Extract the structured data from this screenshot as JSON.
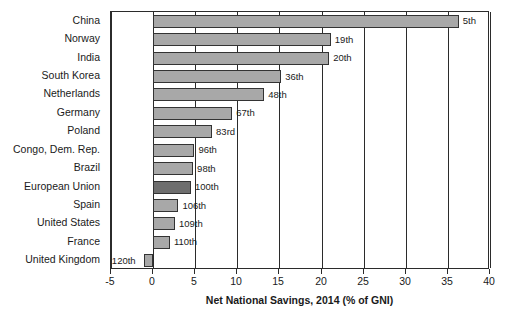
{
  "chart_data": {
    "type": "bar",
    "orientation": "horizontal",
    "title": "",
    "xlabel": "Net National Savings, 2014 (% of GNI)",
    "ylabel": "",
    "xlim": [
      -5,
      40
    ],
    "xticks": [
      -5,
      0,
      5,
      10,
      15,
      20,
      25,
      30,
      35,
      40
    ],
    "xtick_labels": [
      "-5",
      "0",
      "5",
      "10",
      "15",
      "20",
      "25",
      "30",
      "35",
      "40"
    ],
    "grid": true,
    "grid_axis": "x",
    "legend": "none",
    "categories": [
      "China",
      "Norway",
      "India",
      "South Korea",
      "Netherlands",
      "Germany",
      "Poland",
      "Congo, Dem. Rep.",
      "Brazil",
      "European Union",
      "Spain",
      "United States",
      "France",
      "United Kingdom"
    ],
    "values": [
      36.3,
      21.1,
      20.9,
      15.2,
      13.2,
      9.4,
      7.0,
      4.9,
      4.75,
      4.5,
      3.0,
      2.6,
      2.0,
      -1.1
    ],
    "annotations": [
      "5th",
      "19th",
      "20th",
      "36th",
      "48th",
      "67th",
      "83rd",
      "96th",
      "98th",
      "100th",
      "106th",
      "109th",
      "110th",
      "120th"
    ],
    "highlight_category": "European Union",
    "colors": {
      "bar": "#a8a8a8",
      "bar_highlight": "#6e6e6e",
      "bar_edge": "#333333",
      "axis": "#2b2b2b",
      "text": "#1a1a1a",
      "background": "#ffffff"
    }
  }
}
